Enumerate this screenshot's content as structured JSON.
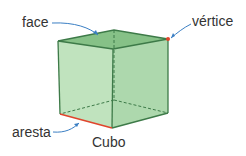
{
  "diagram": {
    "title": "Cubo",
    "labels": {
      "face": "face",
      "vertex": "vértice",
      "edge": "aresta"
    },
    "colors": {
      "cube_fill": "#a8d8a8",
      "cube_top": "#8cc78c",
      "cube_edge": "#3d7a48",
      "highlight": "#e0452c",
      "arrow": "#3b7fc4",
      "text": "#333333"
    }
  }
}
